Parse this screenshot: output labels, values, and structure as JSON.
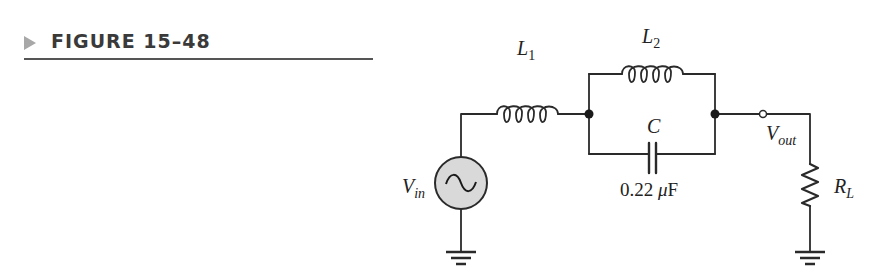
{
  "figure": {
    "label": "FIGURE 15–48",
    "marker_color": "#a8a8a8"
  },
  "circuit": {
    "source": {
      "name": "V",
      "sub": "in",
      "icon": "ac-source-icon",
      "fill": "#d9d9d9"
    },
    "inductor1": {
      "name": "L",
      "sub": "1"
    },
    "inductor2": {
      "name": "L",
      "sub": "2"
    },
    "capacitor": {
      "name": "C",
      "value_num": "0.22 ",
      "value_unit_prefix": "μ",
      "value_unit": "F"
    },
    "output": {
      "name": "V",
      "sub": "out"
    },
    "load": {
      "name": "R",
      "sub": "L"
    }
  }
}
